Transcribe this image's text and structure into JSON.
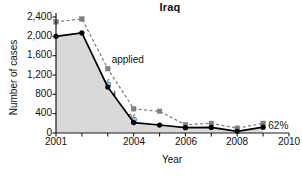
{
  "chart_data": {
    "type": "line",
    "title": "Iraq",
    "xlabel": "Year",
    "ylabel": "Number of cases",
    "x": [
      2001,
      2002,
      2003,
      2004,
      2005,
      2006,
      2007,
      2008,
      2009
    ],
    "xlim": [
      2001,
      2010
    ],
    "ylim": [
      0,
      2400
    ],
    "grid": false,
    "legend": "inline-annotations",
    "xticks": [
      2001,
      2002,
      2003,
      2004,
      2005,
      2006,
      2007,
      2008,
      2009,
      2010
    ],
    "xticklabels": [
      "2001",
      "",
      "",
      "2004",
      "",
      "2006",
      "",
      "2008",
      "",
      "2010"
    ],
    "yticks": [
      0,
      400,
      800,
      1200,
      1600,
      2000,
      2400
    ],
    "yticklabels": [
      "0",
      "400",
      "800",
      "1,200",
      "1,600",
      "2,000",
      "2,400"
    ],
    "series": [
      {
        "name": "applied",
        "style": "dashed",
        "color": "#808080",
        "marker": "square",
        "values": [
          2300,
          2360,
          1330,
          500,
          450,
          170,
          200,
          100,
          200
        ]
      },
      {
        "name": "granted",
        "style": "solid",
        "color": "#000000",
        "marker": "circle",
        "fill": "#d9d9d9",
        "values": [
          2000,
          2070,
          950,
          215,
          165,
          110,
          115,
          35,
          120
        ]
      }
    ],
    "annotations": [
      {
        "text": "87%",
        "x": 2001.35,
        "y": 1830
      },
      {
        "text": "applied",
        "x": 2003.15,
        "y": 1520
      },
      {
        "text": "72%",
        "x": 2002.35,
        "y": 1010
      },
      {
        "text": "granted",
        "x": 2002.0,
        "y": 760
      },
      {
        "text": "45%",
        "x": 2003.35,
        "y": 300
      },
      {
        "text": "62%",
        "x": 2009.2,
        "y": 150
      }
    ]
  },
  "axes": {
    "y_tick_labels": [
      "2,400",
      "2,000",
      "1,600",
      "1,200",
      "800",
      "400",
      "0"
    ],
    "x_tick_labels": [
      "2001",
      "2004",
      "2006",
      "2008",
      "2010"
    ],
    "y_title": "Number of cases",
    "x_title": "Year"
  },
  "labels": {
    "title": "Iraq",
    "pct_87": "87%",
    "pct_72": "72%",
    "pct_45": "45%",
    "pct_62": "62%",
    "applied": "applied",
    "granted": "granted"
  },
  "colors": {
    "applied_line": "#808080",
    "granted_line": "#000000",
    "area_fill": "#d9d9d9",
    "axis": "#1a1a1a",
    "background": "#ffffff"
  }
}
